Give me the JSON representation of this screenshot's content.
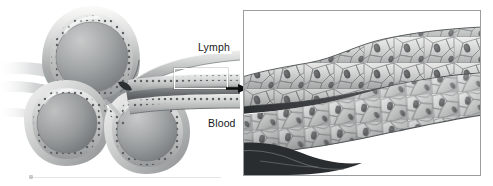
{
  "figure": {
    "type": "anatomical-illustration",
    "style": "grayscale pencil-rendered medical illustration",
    "background_color": "#ffffff",
    "ink_color": "#17191a"
  },
  "labels": {
    "lymph": "Lymph",
    "blood": "Blood"
  },
  "overview": {
    "name": "vessel-cluster-overview",
    "description": "Three cut tubular vessel cross-sections with walls of nucleated cells, converging into a lymphatic and a blood capillary running to the right",
    "vessel_count": 3
  },
  "callout": {
    "name": "magnified-region",
    "description": "White rectangle marking the vessel wall segment enlarged in the inset"
  },
  "arrow": {
    "name": "callout-arrow",
    "direction": "right",
    "color": "#0d0f10"
  },
  "inset": {
    "name": "magnified-endothelium",
    "description": "Enlarged view of two overlapping sheets of polygonal endothelial cells with dark oval nuclei, separated by a dark cleft",
    "border_color": "#9a9ea1"
  },
  "rule": {
    "name": "baseline-rule",
    "color": "#e3e5e6"
  },
  "palette": {
    "tube_light": "#f2f2f1",
    "tube_mid": "#b9bbbb",
    "tube_dark": "#7c7f80",
    "lumen_dark": "#6e7173",
    "cell_fill": "#d9dad9",
    "nucleus": "#3a3d3f"
  }
}
